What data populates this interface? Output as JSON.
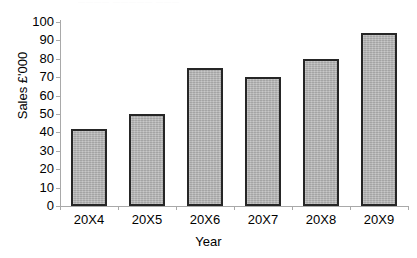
{
  "chart_data": {
    "type": "bar",
    "title": "",
    "xlabel": "Year",
    "ylabel": "Sales £'000",
    "categories": [
      "20X4",
      "20X5",
      "20X6",
      "20X7",
      "20X8",
      "20X9"
    ],
    "values": [
      42,
      50,
      75,
      70,
      80,
      94
    ],
    "ylim": [
      0,
      100
    ],
    "ytick_step": 10,
    "yticks": [
      0,
      10,
      20,
      30,
      40,
      50,
      60,
      70,
      80,
      90,
      100
    ],
    "ytick_labels": [
      "0",
      "10",
      "20",
      "30",
      "40",
      "50",
      "60",
      "70",
      "80",
      "90",
      "100"
    ],
    "grid": false,
    "legend": false,
    "legend_position": "none",
    "series": [
      {
        "name": "Sales",
        "values": [
          42,
          50,
          75,
          70,
          80,
          94
        ]
      }
    ],
    "colors": {
      "bar_fill": "#b4b4b4",
      "bar_border": "#262626",
      "axis_line": "#a9a9a9",
      "text": "#000000",
      "background": "#ffffff"
    }
  },
  "title_strip": {
    "text": "————  —————  ———"
  }
}
